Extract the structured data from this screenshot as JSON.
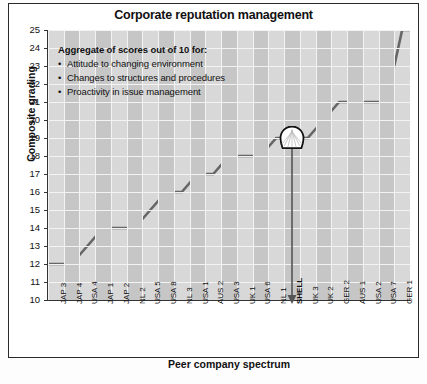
{
  "chart_data": {
    "type": "line",
    "title": "Corporate reputation management",
    "xlabel": "Peer company spectrum",
    "ylabel": "Composite grading",
    "ylim": [
      10,
      25
    ],
    "yticks": [
      10,
      11,
      12,
      13,
      14,
      15,
      16,
      17,
      18,
      19,
      20,
      21,
      22,
      23,
      24,
      25
    ],
    "grid": true,
    "legend": "none",
    "categories": [
      "JAP 3",
      "JAP 4",
      "USA 4",
      "JAP 1",
      "JAP 2",
      "NL 2",
      "USA 5",
      "USA 8",
      "NL 3",
      "USA 1",
      "AUS 2",
      "USA 3",
      "UK 1",
      "USA 6",
      "NL 1",
      "SHELL",
      "UK 3",
      "UK 2",
      "GER 2",
      "AUS 1",
      "USA 2",
      "USA 7",
      "GER 1"
    ],
    "values": [
      12,
      12,
      13,
      14,
      14,
      14,
      15,
      16,
      16,
      17,
      17,
      18,
      18,
      18,
      19,
      19,
      19,
      20,
      21,
      21,
      21,
      21,
      25
    ],
    "highlight": {
      "category": "SHELL",
      "value": 19,
      "marker": "shell-pecten-logo",
      "annotation_arrow": true
    },
    "annotation": {
      "title": "Aggregate of scores out of 10 for:",
      "items": [
        "Attitude to changing environment",
        "Changes to structures and procedures",
        "Proactivity in issue management"
      ]
    },
    "colors": {
      "line": "#666666",
      "plot_background": "#d8d8d8",
      "band": "#c6c6c6",
      "gridline": "#f3f3f3",
      "axis": "#333333",
      "text": "#111111"
    }
  }
}
